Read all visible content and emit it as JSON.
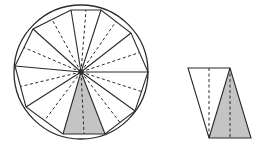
{
  "figure": {
    "colors": {
      "stroke": "#2a2a2a",
      "shade": "#c4c4c4",
      "background": "#ffffff"
    },
    "circle": {
      "cx": 81,
      "cy": 72,
      "r": 67
    },
    "polygon": {
      "sides": 10,
      "vertices": [
        [
          71,
          10
        ],
        [
          101,
          10
        ],
        [
          131,
          33
        ],
        [
          148,
          72
        ],
        [
          135,
          111
        ],
        [
          105,
          134
        ],
        [
          63,
          134
        ],
        [
          26,
          107
        ],
        [
          15,
          66
        ],
        [
          33,
          29
        ]
      ]
    },
    "shaded_triangle_index": 5,
    "rearranged": {
      "outline": [
        [
          188,
          68
        ],
        [
          230,
          68
        ],
        [
          251,
          138
        ],
        [
          209,
          138
        ]
      ],
      "shaded": [
        [
          230,
          68
        ],
        [
          251,
          138
        ],
        [
          209,
          138
        ]
      ],
      "dashed_lines": [
        [
          [
            209,
            68
          ],
          [
            209,
            138
          ]
        ],
        [
          [
            230,
            68
          ],
          [
            230,
            138
          ]
        ]
      ]
    }
  }
}
